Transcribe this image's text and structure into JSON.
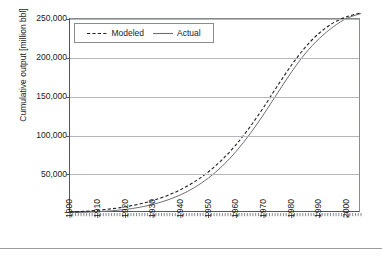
{
  "chart_data": {
    "type": "line",
    "title": "",
    "xlabel": "",
    "ylabel": "Cumulative output [million bbl]",
    "xlim": [
      1900,
      2005
    ],
    "ylim": [
      0,
      250000
    ],
    "grid": true,
    "legend_position": "top-left",
    "y_ticks": [
      "250,000",
      "200,000",
      "150,000",
      "100,000",
      "50,000",
      "-"
    ],
    "y_tick_values": [
      250000,
      200000,
      150000,
      100000,
      50000,
      0
    ],
    "x_ticks": [
      "1900",
      "1910",
      "1920",
      "1930",
      "1940",
      "1950",
      "1960",
      "1970",
      "1980",
      "1990",
      "2000"
    ],
    "x_tick_values": [
      1900,
      1910,
      1920,
      1930,
      1940,
      1950,
      1960,
      1970,
      1980,
      1990,
      2000
    ],
    "x_minor_tick_interval": 1,
    "legend": [
      "Modeled",
      "Actual"
    ],
    "x": [
      1900,
      1905,
      1910,
      1915,
      1920,
      1925,
      1930,
      1935,
      1940,
      1945,
      1950,
      1955,
      1960,
      1965,
      1970,
      1975,
      1980,
      1985,
      1990,
      1995,
      2000,
      2005
    ],
    "series": [
      {
        "name": "Modeled",
        "style": "dashed",
        "color": "#1f1f1f",
        "values": [
          1200,
          2100,
          3500,
          5400,
          8000,
          11500,
          16200,
          22300,
          30200,
          40400,
          53200,
          69100,
          88400,
          111200,
          137000,
          164600,
          191000,
          214000,
          232000,
          245000,
          253000,
          258000
        ]
      },
      {
        "name": "Actual",
        "style": "solid",
        "color": "#6e6f73",
        "values": [
          500,
          900,
          1600,
          2800,
          4600,
          7300,
          11200,
          16500,
          23600,
          33000,
          45200,
          60600,
          79600,
          102200,
          127800,
          155200,
          182000,
          206000,
          225000,
          240000,
          251000,
          257000
        ]
      }
    ],
    "annotations": []
  },
  "axes": {
    "ylabel": "Cumulative output [million bbl]"
  },
  "legend": {
    "modeled_label": "Modeled",
    "actual_label": "Actual"
  }
}
